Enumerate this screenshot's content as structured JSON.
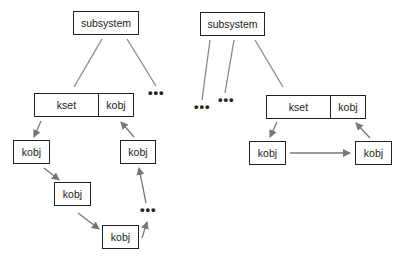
{
  "diagram": {
    "type": "kobject hierarchy",
    "colors": {
      "box_border": "#222222",
      "line": "#777777",
      "arrow": "#777777",
      "background": "#ffffff"
    },
    "left_tree": {
      "subsystem": {
        "label": "subsystem"
      },
      "kset": {
        "kset_label": "kset",
        "kobj_label": "kobj"
      },
      "ellipsis_top": "•••",
      "nodes": [
        {
          "label": "kobj"
        },
        {
          "label": "kobj"
        },
        {
          "label": "kobj"
        },
        {
          "label": "kobj"
        }
      ],
      "ellipsis_loop": "•••"
    },
    "right_tree": {
      "subsystem": {
        "label": "subsystem"
      },
      "ellipsis_a": "•••",
      "ellipsis_b": "•••",
      "kset": {
        "kset_label": "kset",
        "kobj_label": "kobj"
      },
      "nodes": [
        {
          "label": "kobj"
        },
        {
          "label": "kobj"
        }
      ]
    }
  }
}
